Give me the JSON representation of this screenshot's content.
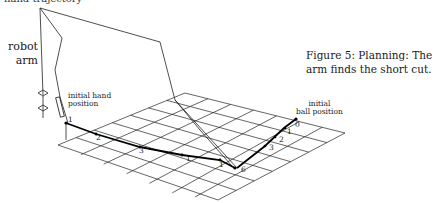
{
  "figure": {
    "top_text": "hand trajectory",
    "arm_label_line1": "robot",
    "arm_label_line2": "arm",
    "caption": "Figure 5: Planning: The arm finds the short cut.",
    "hand_label_line1": "initial hand",
    "hand_label_line2": "position",
    "ball_label_line1": "initial",
    "ball_label_line2": "ball position",
    "hand_path_labels": [
      "1",
      "2",
      "3",
      "1",
      "1",
      "6"
    ],
    "ball_path_labels": [
      "0",
      "1",
      "2",
      "3"
    ]
  }
}
